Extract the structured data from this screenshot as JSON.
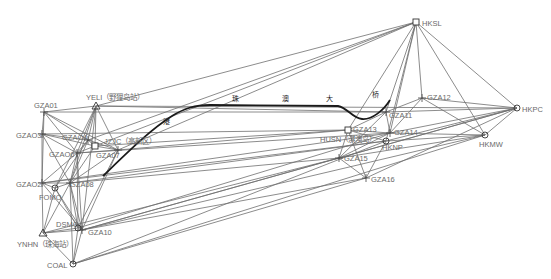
{
  "diagram": {
    "type": "gnss-control-network",
    "bridge_label_chars": [
      "港",
      "珠",
      "澳",
      "大",
      "桥"
    ],
    "nodes": [
      {
        "id": "HKSL",
        "label": "HKSL",
        "x": 416,
        "y": 22,
        "shape": "square",
        "lx": 6,
        "ly": 2
      },
      {
        "id": "GZA12",
        "label": "GZA12",
        "x": 422,
        "y": 98,
        "shape": "cross",
        "lx": 5,
        "ly": 0
      },
      {
        "id": "HKPC",
        "label": "HKPC",
        "x": 517,
        "y": 108,
        "shape": "circle",
        "lx": 5,
        "ly": 2
      },
      {
        "id": "HKMW",
        "label": "HKMW",
        "x": 485,
        "y": 135,
        "shape": "circle",
        "lx": -6,
        "ly": 10
      },
      {
        "id": "GZA11",
        "label": "GZA11",
        "x": 386,
        "y": 112,
        "shape": "cross",
        "lx": 3,
        "ly": 4
      },
      {
        "id": "GZA14",
        "label": "GZA14",
        "x": 390,
        "y": 133,
        "shape": "cross",
        "lx": 4,
        "ly": 0
      },
      {
        "id": "HKNP",
        "label": "HKNP",
        "x": 386,
        "y": 141,
        "shape": "circle",
        "lx": -4,
        "ly": 7
      },
      {
        "id": "GZA13",
        "label": "GZA13",
        "x": 348,
        "y": 130,
        "shape": "square",
        "lx": 5,
        "ly": 0
      },
      {
        "id": "HUSN",
        "label": "HUSN（淇澳岛）",
        "x": 348,
        "y": 130,
        "shape": "none",
        "lx": -28,
        "ly": 10
      },
      {
        "id": "GZA15",
        "label": "GZA15",
        "x": 339,
        "y": 158,
        "shape": "cross",
        "lx": 5,
        "ly": 1
      },
      {
        "id": "GZA16",
        "label": "GZA16",
        "x": 366,
        "y": 178,
        "shape": "cross",
        "lx": 5,
        "ly": 2
      },
      {
        "id": "YELI",
        "label": "YELI（野狸岛站）",
        "x": 96,
        "y": 106,
        "shape": "triangle",
        "lx": -10,
        "ly": -8
      },
      {
        "id": "GZA01",
        "label": "GZA01",
        "x": 44,
        "y": 112,
        "shape": "cross",
        "lx": -10,
        "ly": -6
      },
      {
        "id": "GZA03",
        "label": "GZAO3",
        "x": 42,
        "y": 134,
        "shape": "cross",
        "lx": -26,
        "ly": 2
      },
      {
        "id": "GZA04",
        "label": "GZAO4",
        "x": 88,
        "y": 140,
        "shape": "cross",
        "lx": -26,
        "ly": -2
      },
      {
        "id": "JZJC",
        "label": "JZJC（高新区）",
        "x": 95,
        "y": 146,
        "shape": "square",
        "lx": 9,
        "ly": -4
      },
      {
        "id": "GZA06",
        "label": "GZAO6",
        "x": 77,
        "y": 153,
        "shape": "cross",
        "lx": -28,
        "ly": 2
      },
      {
        "id": "GZA07",
        "label": "GZA07",
        "x": 118,
        "y": 150,
        "shape": "cross",
        "lx": -22,
        "ly": 6
      },
      {
        "id": "GZA02",
        "label": "GZAO2",
        "x": 42,
        "y": 183,
        "shape": "cross",
        "lx": -26,
        "ly": 2
      },
      {
        "id": "GZA08",
        "label": "GZA08",
        "x": 70,
        "y": 183,
        "shape": "cross",
        "lx": 0,
        "ly": 2
      },
      {
        "id": "FOMO",
        "label": "FOMO",
        "x": 55,
        "y": 188,
        "shape": "circle",
        "lx": -16,
        "ly": 10
      },
      {
        "id": "DSMO",
        "label": "DSMO",
        "x": 78,
        "y": 228,
        "shape": "circle",
        "lx": -22,
        "ly": -3
      },
      {
        "id": "GZA10",
        "label": "GZA10",
        "x": 82,
        "y": 230,
        "shape": "cross",
        "lx": 6,
        "ly": 3
      },
      {
        "id": "YNHN",
        "label": "YNHN（珠海站）",
        "x": 43,
        "y": 233,
        "shape": "triangle",
        "lx": -26,
        "ly": 12
      },
      {
        "id": "COAL",
        "label": "COAL",
        "x": 73,
        "y": 264,
        "shape": "circle",
        "lx": -26,
        "ly": 2
      }
    ],
    "edges": [
      [
        "HKSL",
        "GZA12"
      ],
      [
        "HKSL",
        "HKPC"
      ],
      [
        "HKSL",
        "HKMW"
      ],
      [
        "HKSL",
        "GZA11"
      ],
      [
        "HKSL",
        "GZA14"
      ],
      [
        "HKSL",
        "HKNP"
      ],
      [
        "HKSL",
        "GZA13"
      ],
      [
        "HKSL",
        "YELI"
      ],
      [
        "HKSL",
        "JZJC"
      ],
      [
        "HKSL",
        "GZA07"
      ],
      [
        "HKSL",
        "GZA04"
      ],
      [
        "GZA12",
        "HKPC"
      ],
      [
        "GZA12",
        "HKMW"
      ],
      [
        "GZA12",
        "GZA11"
      ],
      [
        "GZA12",
        "GZA14"
      ],
      [
        "HKPC",
        "HKMW"
      ],
      [
        "HKPC",
        "GZA11"
      ],
      [
        "HKPC",
        "GZA14"
      ],
      [
        "HKPC",
        "HKNP"
      ],
      [
        "HKPC",
        "GZA15"
      ],
      [
        "HKPC",
        "GZA16"
      ],
      [
        "HKPC",
        "YELI"
      ],
      [
        "HKPC",
        "GZA10"
      ],
      [
        "HKMW",
        "HKNP"
      ],
      [
        "HKMW",
        "GZA14"
      ],
      [
        "HKMW",
        "GZA15"
      ],
      [
        "HKMW",
        "GZA10"
      ],
      [
        "HKMW",
        "COAL"
      ],
      [
        "GZA11",
        "GZA14"
      ],
      [
        "GZA11",
        "GZA13"
      ],
      [
        "GZA11",
        "GZA15"
      ],
      [
        "GZA11",
        "GZA01"
      ],
      [
        "GZA11",
        "YELI"
      ],
      [
        "GZA14",
        "GZA13"
      ],
      [
        "GZA14",
        "GZA15"
      ],
      [
        "GZA14",
        "GZA06"
      ],
      [
        "GZA14",
        "GZA02"
      ],
      [
        "GZA14",
        "DSMO"
      ],
      [
        "HKNP",
        "GZA13"
      ],
      [
        "HKNP",
        "GZA16"
      ],
      [
        "HKNP",
        "GZA02"
      ],
      [
        "HKNP",
        "GZA08"
      ],
      [
        "HKNP",
        "COAL"
      ],
      [
        "GZA13",
        "GZA15"
      ],
      [
        "GZA13",
        "GZA16"
      ],
      [
        "GZA13",
        "GZA03"
      ],
      [
        "GZA13",
        "JZJC"
      ],
      [
        "GZA13",
        "GZA07"
      ],
      [
        "GZA15",
        "GZA16"
      ],
      [
        "GZA15",
        "GZA08"
      ],
      [
        "GZA15",
        "GZA10"
      ],
      [
        "GZA15",
        "YNHN"
      ],
      [
        "GZA16",
        "COAL"
      ],
      [
        "GZA16",
        "GZA10"
      ],
      [
        "YELI",
        "GZA01"
      ],
      [
        "YELI",
        "GZA04"
      ],
      [
        "YELI",
        "JZJC"
      ],
      [
        "YELI",
        "GZA06"
      ],
      [
        "YELI",
        "GZA07"
      ],
      [
        "YELI",
        "GZA08"
      ],
      [
        "YELI",
        "GZA10"
      ],
      [
        "YELI",
        "FOMO"
      ],
      [
        "GZA01",
        "GZA03"
      ],
      [
        "GZA01",
        "GZA04"
      ],
      [
        "GZA01",
        "GZA06"
      ],
      [
        "GZA01",
        "GZA07"
      ],
      [
        "GZA01",
        "GZA02"
      ],
      [
        "GZA03",
        "GZA04"
      ],
      [
        "GZA03",
        "GZA06"
      ],
      [
        "GZA03",
        "GZA08"
      ],
      [
        "GZA03",
        "GZA02"
      ],
      [
        "GZA03",
        "JZJC"
      ],
      [
        "GZA04",
        "JZJC"
      ],
      [
        "GZA04",
        "GZA06"
      ],
      [
        "GZA04",
        "GZA07"
      ],
      [
        "GZA04",
        "GZA08"
      ],
      [
        "GZA04",
        "FOMO"
      ],
      [
        "JZJC",
        "GZA06"
      ],
      [
        "JZJC",
        "GZA07"
      ],
      [
        "JZJC",
        "GZA08"
      ],
      [
        "GZA06",
        "GZA07"
      ],
      [
        "GZA06",
        "GZA08"
      ],
      [
        "GZA06",
        "GZA02"
      ],
      [
        "GZA06",
        "DSMO"
      ],
      [
        "GZA06",
        "GZA10"
      ],
      [
        "GZA07",
        "GZA08"
      ],
      [
        "GZA07",
        "GZA10"
      ],
      [
        "GZA07",
        "DSMO"
      ],
      [
        "GZA02",
        "GZA08"
      ],
      [
        "GZA02",
        "FOMO"
      ],
      [
        "GZA02",
        "YNHN"
      ],
      [
        "GZA02",
        "GZA10"
      ],
      [
        "GZA08",
        "FOMO"
      ],
      [
        "GZA08",
        "DSMO"
      ],
      [
        "GZA08",
        "GZA10"
      ],
      [
        "GZA08",
        "YNHN"
      ],
      [
        "GZA08",
        "COAL"
      ],
      [
        "FOMO",
        "YNHN"
      ],
      [
        "FOMO",
        "GZA10"
      ],
      [
        "FOMO",
        "DSMO"
      ],
      [
        "DSMO",
        "GZA10"
      ],
      [
        "DSMO",
        "YNHN"
      ],
      [
        "GZA10",
        "YNHN"
      ],
      [
        "GZA10",
        "COAL"
      ],
      [
        "YNHN",
        "COAL"
      ],
      [
        "DSMO",
        "COAL"
      ]
    ],
    "bridge_path": "M103,176 C130,150 150,130 172,116 C185,108 195,105 210,105 L338,106 C348,108 352,118 362,119 C372,120 384,110 390,100",
    "bridge_label_positions": [
      [
        163,
        124
      ],
      [
        232,
        101
      ],
      [
        282,
        101
      ],
      [
        326,
        101
      ],
      [
        372,
        97
      ]
    ]
  }
}
